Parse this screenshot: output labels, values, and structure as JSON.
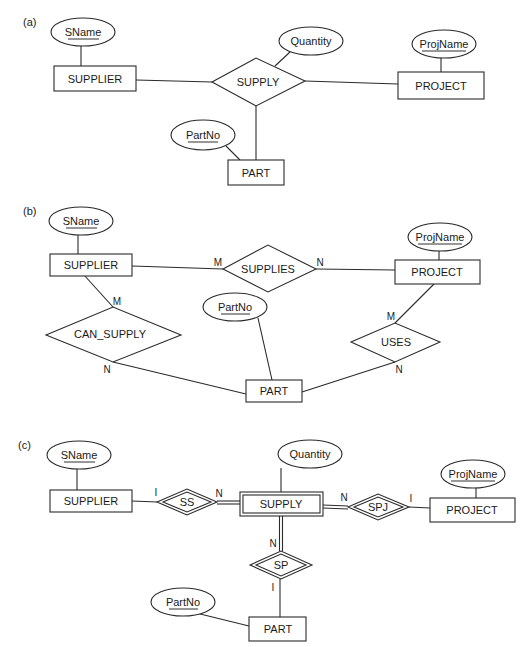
{
  "figure": {
    "panels": [
      {
        "label": "(a)",
        "entities": [
          "SUPPLIER",
          "PROJECT",
          "PART"
        ],
        "relationships": [
          "SUPPLY"
        ],
        "attributes": [
          {
            "name": "SName",
            "key": true,
            "of": "SUPPLIER"
          },
          {
            "name": "Quantity",
            "key": false,
            "of": "SUPPLY"
          },
          {
            "name": "ProjName",
            "key": true,
            "of": "PROJECT"
          },
          {
            "name": "PartNo",
            "key": true,
            "of": "PART"
          }
        ]
      },
      {
        "label": "(b)",
        "entities": [
          "SUPPLIER",
          "PROJECT",
          "PART"
        ],
        "relationships": [
          "SUPPLIES",
          "CAN_SUPPLY",
          "USES"
        ],
        "attributes": [
          {
            "name": "SName",
            "key": true,
            "of": "SUPPLIER"
          },
          {
            "name": "ProjName",
            "key": true,
            "of": "PROJECT"
          },
          {
            "name": "PartNo",
            "key": true,
            "of": "PART"
          }
        ],
        "cardinalities": {
          "supplies_supplier": "M",
          "supplies_project": "N",
          "can_supply_supplier": "M",
          "can_supply_part": "N",
          "uses_project": "M",
          "uses_part": "N"
        }
      },
      {
        "label": "(c)",
        "entities": [
          "SUPPLIER",
          "SUPPLY",
          "PROJECT",
          "PART"
        ],
        "weak_entity": "SUPPLY",
        "identifying_relationships": [
          "SS",
          "SPJ",
          "SP"
        ],
        "attributes": [
          {
            "name": "SName",
            "key": true,
            "of": "SUPPLIER"
          },
          {
            "name": "Quantity",
            "key": false,
            "of": "SUPPLY"
          },
          {
            "name": "ProjName",
            "key": true,
            "of": "PROJECT"
          },
          {
            "name": "PartNo",
            "key": true,
            "of": "PART"
          }
        ],
        "cardinalities": {
          "ss_supplier": "I",
          "ss_supply": "N",
          "spj_supply": "N",
          "spj_project": "I",
          "sp_supply": "N",
          "sp_part": "I"
        }
      }
    ]
  }
}
